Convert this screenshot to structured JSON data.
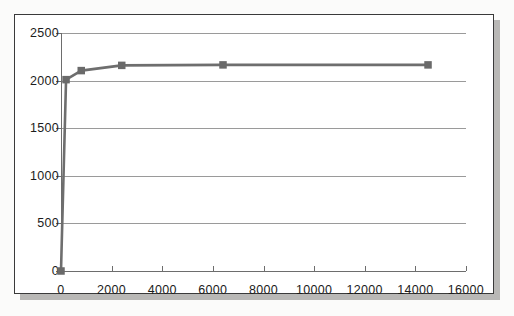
{
  "figure": {
    "frame_border_color": "#3a3a3a",
    "background_color": "#ffffff",
    "shadow_color": "#b9b8b6"
  },
  "chart_data": {
    "type": "line",
    "title": "",
    "subtitle": "",
    "xlabel": "",
    "ylabel": "",
    "xlim": [
      0,
      16000
    ],
    "ylim": [
      0,
      2500
    ],
    "grid": true,
    "legend": "none",
    "marker": "square",
    "series_color": "#6e6e6e",
    "marker_color": "#6a6a6a",
    "gridline_color": "#9a9a9a",
    "axis_color": "#6d6d6d",
    "xticks": [
      0,
      2000,
      4000,
      6000,
      8000,
      10000,
      12000,
      14000,
      16000
    ],
    "xtick_labels": [
      "0",
      "2000",
      "4000",
      "6000",
      "8000",
      "10000",
      "12000",
      "14000",
      "16000"
    ],
    "yticks": [
      0,
      500,
      1000,
      1500,
      2000,
      2500
    ],
    "ytick_labels": [
      "0",
      "500",
      "1000",
      "1500",
      "2000",
      "2500"
    ],
    "series": [
      {
        "name": "series-1",
        "x": [
          0,
          200,
          800,
          2400,
          6400,
          14500
        ],
        "y": [
          0,
          2010,
          2105,
          2160,
          2165,
          2165
        ]
      }
    ]
  }
}
